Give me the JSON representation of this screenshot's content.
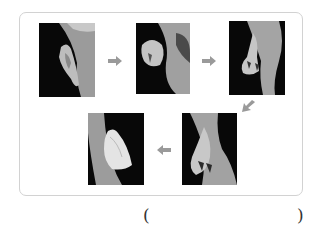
{
  "figure": {
    "arrow_color": "#9a9a9a",
    "border_color": "#d2d2d2",
    "steps": [
      {
        "order": 1,
        "label": "pupa"
      },
      {
        "order": 2,
        "label": "pupa splitting"
      },
      {
        "order": 3,
        "label": "butterfly emerging"
      },
      {
        "order": 4,
        "label": "wings hanging"
      },
      {
        "order": 5,
        "label": "adult butterfly"
      }
    ]
  },
  "answer": {
    "open_paren": "(",
    "close_paren": ")",
    "value": ""
  }
}
